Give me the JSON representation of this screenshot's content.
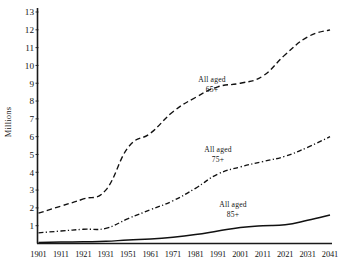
{
  "chart_data": {
    "type": "line",
    "title": "",
    "xlabel": "",
    "ylabel": "Millions",
    "ylim": [
      0,
      13
    ],
    "grid": false,
    "legend_position": "inline-annotations",
    "x": [
      "1901",
      "1911",
      "1921",
      "1931",
      "1951",
      "1961",
      "1971",
      "1981",
      "1991",
      "2001",
      "2011",
      "2021",
      "2031",
      "2041"
    ],
    "yticks": [
      "1",
      "2",
      "3",
      "4",
      "5",
      "6",
      "7",
      "8",
      "9",
      "10",
      "11",
      "12",
      "13"
    ],
    "series": [
      {
        "name": "All aged 65+",
        "style": "dashed",
        "values": [
          1.7,
          2.1,
          2.5,
          3.0,
          5.4,
          6.2,
          7.4,
          8.2,
          8.8,
          9.0,
          9.4,
          10.6,
          11.6,
          12.0
        ]
      },
      {
        "name": "All aged 75+",
        "style": "dash-dot",
        "values": [
          0.6,
          0.7,
          0.8,
          0.85,
          1.4,
          1.9,
          2.4,
          3.1,
          3.9,
          4.3,
          4.6,
          4.9,
          5.4,
          6.0
        ]
      },
      {
        "name": "All aged 85+",
        "style": "solid",
        "values": [
          0.06,
          0.08,
          0.1,
          0.12,
          0.2,
          0.25,
          0.35,
          0.5,
          0.7,
          0.9,
          1.0,
          1.05,
          1.3,
          1.6
        ]
      }
    ],
    "annotations": [
      {
        "label_line1": "All aged",
        "label_line2": "65+",
        "series": "All aged 65+"
      },
      {
        "label_line1": "All aged",
        "label_line2": "75+",
        "series": "All aged 75+"
      },
      {
        "label_line1": "All aged",
        "label_line2": "85+",
        "series": "All aged 85+"
      }
    ],
    "colors": {
      "line": "#111111",
      "axis": "#1a1a1a",
      "background": "#ffffff"
    }
  }
}
